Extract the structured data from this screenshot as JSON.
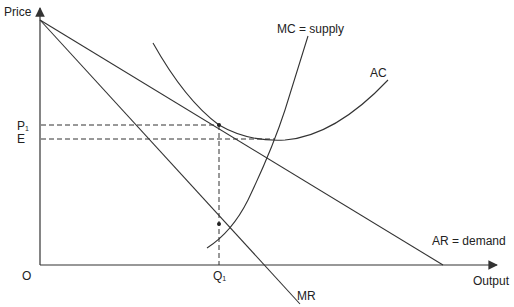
{
  "diagram": {
    "type": "economics-monopoly-cost-revenue",
    "axes": {
      "y_label": "Price",
      "x_label": "Output",
      "origin_label": "O"
    },
    "price_levels": [
      {
        "id": "P1",
        "label": "P",
        "subscript": "1"
      },
      {
        "id": "E",
        "label": "E"
      }
    ],
    "quantity_levels": [
      {
        "id": "Q1",
        "label": "Q",
        "subscript": "1"
      }
    ],
    "curves": [
      {
        "id": "mc",
        "label": "MC = supply"
      },
      {
        "id": "ac",
        "label": "AC"
      },
      {
        "id": "ar",
        "label": "AR = demand"
      },
      {
        "id": "mr",
        "label": "MR"
      }
    ],
    "colors": {
      "line": "#333333",
      "text": "#222222",
      "background": "#ffffff"
    }
  }
}
